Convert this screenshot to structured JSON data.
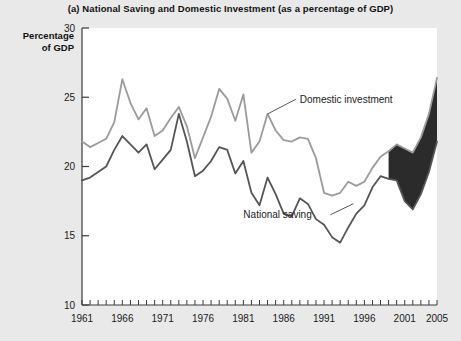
{
  "chart_data": {
    "type": "line",
    "title": "(a) National Saving and Domestic Investment (as a percentage of GDP)",
    "ylabel_line1": "Percentage",
    "ylabel_line2": "of GDP",
    "xlabel": "",
    "ylim": [
      10,
      30
    ],
    "xlim": [
      1961,
      2005
    ],
    "ytick_labels": [
      "10",
      "15",
      "20",
      "25",
      "30"
    ],
    "yticks": [
      10,
      15,
      20,
      25,
      30
    ],
    "xtick_labels": [
      "1961",
      "1966",
      "1971",
      "1976",
      "1981",
      "1986",
      "1991",
      "1996",
      "2001",
      "2005"
    ],
    "xticks": [
      1961,
      1966,
      1971,
      1976,
      1981,
      1986,
      1991,
      1996,
      2001,
      2005
    ],
    "grid": false,
    "legend_position": "inline-annotations",
    "annotations": [
      {
        "text": "Domestic investment",
        "x": 1988,
        "y": 24.6
      },
      {
        "text": "National saving",
        "x": 1981,
        "y": 16.3
      }
    ],
    "x": [
      1961,
      1962,
      1963,
      1964,
      1965,
      1966,
      1967,
      1968,
      1969,
      1970,
      1971,
      1972,
      1973,
      1974,
      1975,
      1976,
      1977,
      1978,
      1979,
      1980,
      1981,
      1982,
      1983,
      1984,
      1985,
      1986,
      1987,
      1988,
      1989,
      1990,
      1991,
      1992,
      1993,
      1994,
      1995,
      1996,
      1997,
      1998,
      1999,
      2000,
      2001,
      2002,
      2003,
      2004,
      2005
    ],
    "series": [
      {
        "name": "Domestic investment",
        "color": "#9b9b9b",
        "values": [
          21.8,
          21.4,
          21.7,
          22.0,
          23.2,
          26.3,
          24.6,
          23.4,
          24.2,
          22.2,
          22.6,
          23.5,
          24.3,
          22.9,
          20.6,
          22.1,
          23.6,
          25.6,
          24.9,
          23.3,
          25.2,
          21.0,
          21.8,
          23.8,
          22.6,
          21.9,
          21.8,
          22.1,
          22.0,
          20.6,
          18.1,
          17.9,
          18.1,
          18.9,
          18.6,
          18.9,
          19.9,
          20.7,
          21.1,
          21.6,
          21.3,
          21.0,
          22.1,
          23.8,
          26.4
        ]
      },
      {
        "name": "National saving",
        "color": "#555555",
        "values": [
          19.0,
          19.2,
          19.6,
          20.0,
          21.2,
          22.2,
          21.6,
          21.0,
          21.6,
          19.8,
          20.5,
          21.2,
          23.8,
          21.8,
          19.3,
          19.7,
          20.4,
          21.4,
          21.2,
          19.5,
          20.4,
          18.1,
          17.2,
          19.2,
          18.0,
          16.6,
          16.4,
          17.7,
          17.3,
          16.2,
          15.8,
          14.9,
          14.5,
          15.6,
          16.6,
          17.2,
          18.5,
          19.3,
          19.1,
          19.0,
          17.5,
          16.9,
          18.0,
          19.6,
          21.8
        ]
      }
    ],
    "shaded_band": {
      "description": "dark filled gap between investment and saving",
      "color": "#2b2b2b",
      "start_year": 1999,
      "end_year": 2005
    }
  }
}
